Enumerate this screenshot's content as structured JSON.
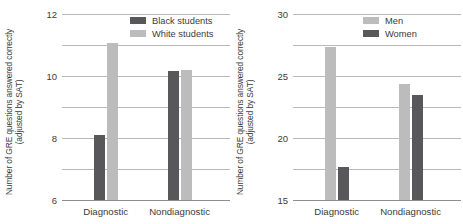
{
  "figure": {
    "background": "#ffffff"
  },
  "colors": {
    "dark": "#58585a",
    "light": "#bcbcbc",
    "gridline": "#b9b9b9",
    "axis": "#8e8e8e",
    "text": "#3b3b3b"
  },
  "panels": [
    {
      "id": "race-panel",
      "ytitle": "Number of GRE questions answered correctly (adjusted by SAT)",
      "yticks": [
        "0",
        "2",
        "4",
        "6",
        "8",
        "10",
        "12"
      ],
      "categories": [
        "Diagnostic",
        "Nondiagnostic"
      ],
      "legend": [
        {
          "label": "Black students",
          "color": "#58585a"
        },
        {
          "label": "White students",
          "color": "#bcbcbc"
        }
      ],
      "chart_data": {
        "type": "bar",
        "title": "",
        "xlabel": "",
        "ylabel": "Number of GRE questions answered correctly (adjusted by SAT)",
        "ylim": [
          0,
          12
        ],
        "ytick_values": [
          0,
          2,
          4,
          6,
          8,
          10,
          12
        ],
        "grid": true,
        "legend_position": "top-right",
        "categories": [
          "Diagnostic",
          "Nondiagnostic"
        ],
        "series": [
          {
            "name": "Black students",
            "color": "#58585a",
            "values": [
              4.2,
              8.3
            ]
          },
          {
            "name": "White students",
            "color": "#bcbcbc",
            "values": [
              10.1,
              8.4
            ]
          }
        ]
      }
    },
    {
      "id": "gender-panel",
      "ytitle": "Number of GRE questions answered correctly (adjusted by SAT)",
      "yticks": [
        "0",
        "5",
        "10",
        "15",
        "20",
        "25",
        "30"
      ],
      "categories": [
        "Diagnostic",
        "Nondiagnostic"
      ],
      "legend": [
        {
          "label": "Men",
          "color": "#bcbcbc"
        },
        {
          "label": "Women",
          "color": "#58585a"
        }
      ],
      "chart_data": {
        "type": "bar",
        "title": "",
        "xlabel": "",
        "ylabel": "Number of GRE questions answered correctly (adjusted by SAT)",
        "ylim": [
          0,
          30
        ],
        "ytick_values": [
          0,
          5,
          10,
          15,
          20,
          25,
          30
        ],
        "grid": true,
        "legend_position": "top-right",
        "categories": [
          "Diagnostic",
          "Nondiagnostic"
        ],
        "series": [
          {
            "name": "Men",
            "color": "#bcbcbc",
            "values": [
              24.6,
              18.7
            ]
          },
          {
            "name": "Women",
            "color": "#58585a",
            "values": [
              5.4,
              16.9
            ]
          }
        ]
      }
    }
  ]
}
